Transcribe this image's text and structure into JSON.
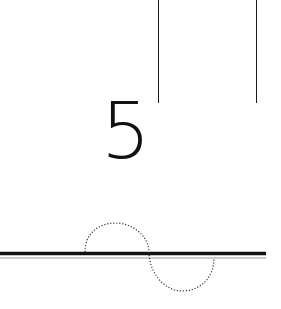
{
  "figure": {
    "label": "5",
    "colors": {
      "line": "#111111",
      "secondary_line": "#9a9a9a",
      "dotted_curve": "#333333",
      "background": "#ffffff"
    },
    "elements": [
      "two vertical lines at top",
      "numeral 5",
      "thick horizontal line with thin parallel line",
      "dotted S-shaped curve crossing the horizontal line"
    ]
  }
}
